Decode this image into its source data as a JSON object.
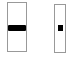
{
  "canvas": {
    "background_color": "#ffffff"
  },
  "colors": {
    "track_border": "#999999",
    "track_fill": "#ffffff",
    "thumb": "#000000"
  },
  "widgets": [
    {
      "type": "vertical-slider",
      "label": "wide vertical slider",
      "thumb_shape": "horizontal-bar",
      "thumb_position": "middle"
    },
    {
      "type": "vertical-slider",
      "label": "narrow vertical slider",
      "thumb_shape": "small-square",
      "thumb_position": "middle"
    }
  ]
}
